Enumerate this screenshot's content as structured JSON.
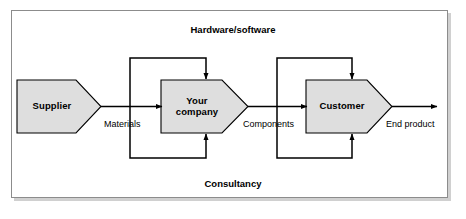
{
  "diagram": {
    "type": "process-flow",
    "title_top": "Hardware/software",
    "title_bottom": "Consultancy",
    "frame": {
      "border_color": "#8c8c8c",
      "background_color": "#ffffff"
    },
    "node_fill_color": "#dedede",
    "node_stroke_color": "#000000",
    "arrow_color": "#000000",
    "nodes": [
      {
        "id": "supplier",
        "label": "Supplier"
      },
      {
        "id": "your-company",
        "label": "Your\ncompany"
      },
      {
        "id": "customer",
        "label": "Customer"
      }
    ],
    "flow_labels": [
      {
        "id": "materials",
        "text": "Materials"
      },
      {
        "id": "components",
        "text": "Components"
      },
      {
        "id": "end-product",
        "text": "End product"
      }
    ],
    "bands": [
      {
        "id": "hardware-software",
        "text": "Hardware/software",
        "position": "top"
      },
      {
        "id": "consultancy",
        "text": "Consultancy",
        "position": "bottom"
      }
    ]
  }
}
